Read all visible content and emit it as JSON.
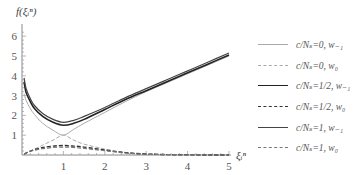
{
  "chart_data": {
    "type": "line",
    "title": "",
    "ylabel": "f(ξ_i^n)",
    "xlabel": "ξ_i^n",
    "xlim": [
      0,
      5
    ],
    "ylim": [
      0,
      6.5
    ],
    "x_ticks": [
      "1",
      "2",
      "3",
      "4",
      "5"
    ],
    "y_ticks": [
      "1",
      "2",
      "3",
      "4",
      "5",
      "6"
    ],
    "grid": false,
    "legend_position": "right",
    "x": [
      0.05,
      0.1,
      0.2,
      0.3,
      0.5,
      0.75,
      1.0,
      1.25,
      1.5,
      2.0,
      2.5,
      3.0,
      3.5,
      4.0,
      4.5,
      5.0
    ],
    "series": [
      {
        "name": "c/N_s=0, w_-1",
        "style": "solid",
        "color": "#aaaaaa",
        "width": 1,
        "values": [
          3.1,
          2.75,
          2.35,
          2.05,
          1.6,
          1.25,
          1.0,
          1.3,
          1.6,
          2.15,
          2.7,
          3.2,
          3.65,
          4.1,
          4.55,
          5.0
        ]
      },
      {
        "name": "c/N_s=0, w_0",
        "style": "dashed",
        "color": "#aaaaaa",
        "width": 1,
        "values": [
          0.05,
          0.1,
          0.2,
          0.3,
          0.5,
          0.75,
          1.0,
          0.75,
          0.55,
          0.3,
          0.12,
          0.05,
          0.02,
          0.01,
          0.0,
          0.0
        ]
      },
      {
        "name": "c/N_s=1/2, w_-1",
        "style": "solid",
        "color": "#222222",
        "width": 1.6,
        "values": [
          3.7,
          3.15,
          2.7,
          2.35,
          1.95,
          1.65,
          1.5,
          1.6,
          1.8,
          2.3,
          2.8,
          3.25,
          3.7,
          4.15,
          4.6,
          5.05
        ]
      },
      {
        "name": "c/N_s=1/2, w_0",
        "style": "dashed",
        "color": "#333333",
        "width": 1.4,
        "values": [
          0.05,
          0.1,
          0.2,
          0.27,
          0.38,
          0.45,
          0.48,
          0.45,
          0.4,
          0.25,
          0.12,
          0.05,
          0.02,
          0.01,
          0.0,
          0.0
        ]
      },
      {
        "name": "c/N_s=1, w_-1",
        "style": "solid",
        "color": "#444444",
        "width": 1.2,
        "values": [
          3.9,
          3.35,
          2.85,
          2.5,
          2.1,
          1.8,
          1.65,
          1.75,
          1.95,
          2.4,
          2.9,
          3.35,
          3.8,
          4.25,
          4.7,
          5.15
        ]
      },
      {
        "name": "c/N_s=1, w_0",
        "style": "dashed",
        "color": "#777777",
        "width": 1.2,
        "values": [
          0.05,
          0.1,
          0.18,
          0.24,
          0.32,
          0.38,
          0.4,
          0.38,
          0.33,
          0.22,
          0.1,
          0.04,
          0.02,
          0.01,
          0.0,
          0.0
        ]
      }
    ]
  },
  "legend": {
    "items": [
      {
        "label": "c/Nₛ=0, w₋₁",
        "style": "solid",
        "color": "#aaaaaa",
        "width": 1
      },
      {
        "label": "c/Nₛ=0, w₀",
        "style": "dashed",
        "color": "#aaaaaa",
        "width": 1
      },
      {
        "label": "c/Nₛ=1/2, w₋₁",
        "style": "solid",
        "color": "#222222",
        "width": 1.6
      },
      {
        "label": "c/Nₛ=1/2, w₀",
        "style": "dashed",
        "color": "#333333",
        "width": 1.4
      },
      {
        "label": "c/Nₛ=1, w₋₁",
        "style": "solid",
        "color": "#444444",
        "width": 1.2
      },
      {
        "label": "c/Nₛ=1, w₀",
        "style": "dashed",
        "color": "#777777",
        "width": 1.2
      }
    ]
  },
  "axes": {
    "y_title": "f(ξᵢⁿ)",
    "x_title": "ξᵢⁿ"
  }
}
